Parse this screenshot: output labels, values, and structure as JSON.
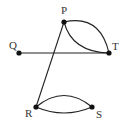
{
  "diagram": {
    "type": "graph",
    "nodes": [
      {
        "id": "P",
        "label": "P",
        "x": 64,
        "y": 22,
        "lx": 61,
        "ly": 14
      },
      {
        "id": "Q",
        "label": "Q",
        "x": 19,
        "y": 53,
        "lx": 9,
        "ly": 49
      },
      {
        "id": "T",
        "label": "T",
        "x": 109,
        "y": 53,
        "lx": 112,
        "ly": 50
      },
      {
        "id": "R",
        "label": "R",
        "x": 36,
        "y": 107,
        "lx": 25,
        "ly": 117
      },
      {
        "id": "S",
        "label": "S",
        "x": 92,
        "y": 107,
        "lx": 96,
        "ly": 118
      }
    ],
    "edges": [
      {
        "from": "Q",
        "to": "T",
        "shape": "straight"
      },
      {
        "from": "P",
        "to": "R",
        "shape": "straight"
      },
      {
        "from": "P",
        "to": "T",
        "shape": "arc-upper"
      },
      {
        "from": "P",
        "to": "T",
        "shape": "arc-lower"
      },
      {
        "from": "R",
        "to": "S",
        "shape": "arc-upper"
      },
      {
        "from": "R",
        "to": "S",
        "shape": "arc-lower"
      }
    ]
  }
}
